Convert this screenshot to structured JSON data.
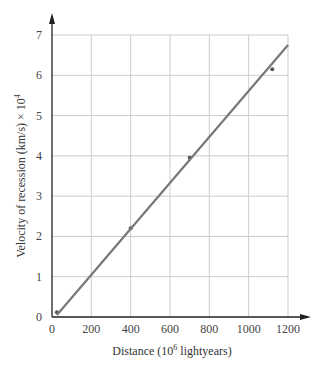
{
  "chart_data": {
    "type": "scatter",
    "title": "",
    "xlabel": "Distance (10^6 lightyears)",
    "ylabel": "Velocity of recession (km/s) × 10^4",
    "xlim": [
      0,
      1200
    ],
    "ylim": [
      0,
      7
    ],
    "grid": true,
    "x_ticks": [
      "0",
      "200",
      "400",
      "600",
      "800",
      "1000",
      "1200"
    ],
    "y_ticks": [
      "0",
      "1",
      "2",
      "3",
      "4",
      "5",
      "6",
      "7"
    ],
    "series": [
      {
        "name": "observations",
        "type": "scatter",
        "x": [
          25,
          400,
          700,
          1120
        ],
        "y": [
          0.12,
          2.2,
          3.95,
          6.15
        ]
      },
      {
        "name": "fit line",
        "type": "line",
        "x": [
          25,
          1200
        ],
        "y": [
          0.05,
          6.75
        ]
      }
    ],
    "colors": {
      "line": "#777777",
      "points": "#555555",
      "grid": "#cccccc",
      "axis": "#222222"
    }
  },
  "labels": {
    "xlabel_main": "Distance (10",
    "xlabel_sup": "6",
    "xlabel_tail": " lightyears)",
    "ylabel_main": "Velocity of recession (km/s) × 10",
    "ylabel_sup": "4"
  }
}
